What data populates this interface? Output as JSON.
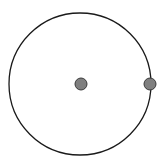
{
  "diagram": {
    "type": "circle-with-points",
    "canvas": {
      "width": 168,
      "height": 158,
      "background": "#ffffff"
    },
    "circle": {
      "cx": 80,
      "cy": 84,
      "r": 71,
      "stroke": "#1a1a1a",
      "stroke_width": 1.3,
      "fill": "none"
    },
    "points": [
      {
        "name": "center",
        "cx": 81,
        "cy": 84,
        "r": 6,
        "fill": "#7f7f7f",
        "stroke": "#3a3a3a"
      },
      {
        "name": "on-circumference",
        "cx": 150,
        "cy": 84,
        "r": 6,
        "fill": "#7f7f7f",
        "stroke": "#3a3a3a"
      }
    ]
  }
}
